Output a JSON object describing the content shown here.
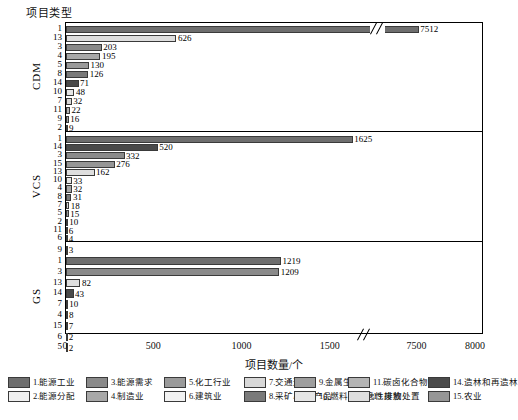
{
  "axis": {
    "y_title": "项目类型",
    "x_title": "项目数量/个",
    "x_ticks": [
      "0",
      "500",
      "1000",
      "1500",
      "7500",
      "8000"
    ],
    "groups": [
      "CDM",
      "VCS",
      "GS"
    ]
  },
  "chart_data": {
    "type": "bar",
    "orientation": "horizontal",
    "title": "",
    "xlabel": "项目数量/个",
    "ylabel": "项目类型",
    "xlim": [
      0,
      8000
    ],
    "axis_break": {
      "from": 1700,
      "to": 7300
    },
    "grid": false,
    "legend_position": "bottom",
    "panels": [
      {
        "name": "CDM",
        "categories": [
          "1",
          "13",
          "3",
          "4",
          "5",
          "8",
          "14",
          "10",
          "7",
          "11",
          "9",
          "2"
        ],
        "values": [
          7512,
          626,
          203,
          195,
          130,
          126,
          71,
          48,
          32,
          22,
          16,
          9
        ]
      },
      {
        "name": "VCS",
        "categories": [
          "1",
          "14",
          "3",
          "15",
          "13",
          "10",
          "4",
          "8",
          "7",
          "5",
          "2",
          "11",
          "6"
        ],
        "values": [
          1625,
          520,
          332,
          276,
          162,
          33,
          32,
          31,
          18,
          15,
          10,
          6,
          4
        ]
      },
      {
        "name": "GS",
        "categories": [
          "9",
          "1",
          "3",
          "13",
          "14",
          "7",
          "4",
          "15",
          "6",
          "5"
        ],
        "values": [
          3,
          1219,
          1209,
          82,
          43,
          10,
          8,
          7,
          2,
          2
        ]
      }
    ],
    "legend": [
      {
        "id": "1",
        "label": "1.能源工业",
        "color": "#6e6e6e"
      },
      {
        "id": "2",
        "label": "2.能源分配",
        "color": "#efefef"
      },
      {
        "id": "3",
        "label": "3.能源需求",
        "color": "#8a8a8a"
      },
      {
        "id": "4",
        "label": "4.制造业",
        "color": "#a8a8a8"
      },
      {
        "id": "5",
        "label": "5.化工行业",
        "color": "#9a9a9a"
      },
      {
        "id": "6",
        "label": "6.建筑业",
        "color": "#f2f2f2"
      },
      {
        "id": "7",
        "label": "7.交通运输",
        "color": "#d8d8d8"
      },
      {
        "id": "8",
        "label": "8.采矿/矿产产品",
        "color": "#7a7a7a"
      },
      {
        "id": "9",
        "label": "9.金属生产",
        "color": "#9e9e9e"
      },
      {
        "id": "10",
        "label": "10.燃料的飞逸性排放",
        "color": "#e6e6e6"
      },
      {
        "id": "11",
        "label": "11.碳卤化合物等",
        "color": "#b4b4b4"
      },
      {
        "id": "13",
        "label": "13.废物处置",
        "color": "#dedede"
      },
      {
        "id": "14",
        "label": "14.造林和再造林",
        "color": "#4a4a4a"
      },
      {
        "id": "15",
        "label": "15.农业",
        "color": "#969696"
      }
    ]
  }
}
